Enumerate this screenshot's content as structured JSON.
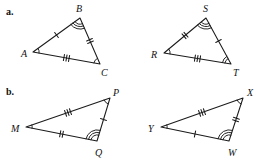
{
  "figure": {
    "type": "geometry-congruent-triangle-pairs",
    "parts": [
      {
        "key": "a",
        "label": "a.",
        "triangles": [
          {
            "name": "ABC",
            "vertices": [
              {
                "label": "A",
                "label_x": 21,
                "label_y": 49,
                "x": 33,
                "y": 52,
                "angle_arcs": 1
              },
              {
                "label": "B",
                "label_x": 76,
                "label_y": 4,
                "x": 80,
                "y": 18,
                "angle_arcs": 3
              },
              {
                "label": "C",
                "label_x": 101,
                "label_y": 68,
                "x": 100,
                "y": 64,
                "angle_arcs": 1
              }
            ],
            "sides": [
              {
                "from": "A",
                "to": "B",
                "ticks": 1
              },
              {
                "from": "B",
                "to": "C",
                "ticks": 2
              },
              {
                "from": "A",
                "to": "C",
                "ticks": 3
              }
            ]
          },
          {
            "name": "RST",
            "vertices": [
              {
                "label": "R",
                "label_x": 151,
                "label_y": 50,
                "x": 164,
                "y": 53,
                "angle_arcs": 1
              },
              {
                "label": "S",
                "label_x": 203,
                "label_y": 4,
                "x": 206,
                "y": 18,
                "angle_arcs": 3
              },
              {
                "label": "T",
                "label_x": 233,
                "label_y": 68,
                "x": 231,
                "y": 64,
                "angle_arcs": 2
              }
            ],
            "sides": [
              {
                "from": "R",
                "to": "S",
                "ticks": 2
              },
              {
                "from": "S",
                "to": "T",
                "ticks": 1
              },
              {
                "from": "R",
                "to": "T",
                "ticks": 3
              }
            ]
          }
        ]
      },
      {
        "key": "b",
        "label": "b.",
        "triangles": [
          {
            "name": "MPQ",
            "vertices": [
              {
                "label": "M",
                "label_x": 11,
                "label_y": 124,
                "x": 26,
                "y": 127,
                "angle_arcs": 1
              },
              {
                "label": "P",
                "label_x": 113,
                "label_y": 88,
                "x": 110,
                "y": 98,
                "angle_arcs": 1
              },
              {
                "label": "Q",
                "label_x": 95,
                "label_y": 148,
                "x": 97,
                "y": 141,
                "angle_arcs": 3
              }
            ],
            "sides": [
              {
                "from": "M",
                "to": "P",
                "ticks": 3
              },
              {
                "from": "P",
                "to": "Q",
                "ticks": 1
              },
              {
                "from": "M",
                "to": "Q",
                "ticks": 2
              }
            ]
          },
          {
            "name": "YXW",
            "vertices": [
              {
                "label": "Y",
                "label_x": 148,
                "label_y": 124,
                "x": 161,
                "y": 127,
                "angle_arcs": 1
              },
              {
                "label": "X",
                "label_x": 247,
                "label_y": 88,
                "x": 243,
                "y": 98,
                "angle_arcs": 1
              },
              {
                "label": "W",
                "label_x": 228,
                "label_y": 148,
                "x": 229,
                "y": 141,
                "angle_arcs": 3
              }
            ],
            "sides": [
              {
                "from": "Y",
                "to": "X",
                "ticks": 3
              },
              {
                "from": "X",
                "to": "W",
                "ticks": 2
              },
              {
                "from": "Y",
                "to": "W",
                "ticks": 1
              }
            ]
          }
        ]
      }
    ]
  }
}
